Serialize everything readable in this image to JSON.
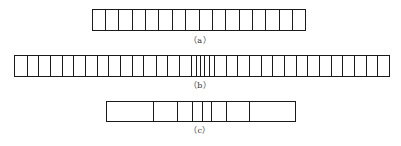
{
  "figure": {
    "colors": {
      "line": "#1a1a1a",
      "caption": "#333333",
      "background": "#ffffff"
    },
    "strips": [
      {
        "id": "a",
        "caption": "（a）",
        "description": "16 equal-width cells",
        "box": {
          "left": 92,
          "top": 9,
          "right": 306,
          "bottom": 31
        },
        "dividers": [
          105.4,
          118.8,
          132.1,
          145.5,
          158.9,
          172.3,
          185.6,
          199,
          212.4,
          225.8,
          239.1,
          252.5,
          265.9,
          279.3,
          292.6
        ],
        "caption_pos": {
          "x": 200,
          "y": 36
        }
      },
      {
        "id": "b",
        "caption": "（b）",
        "description": "uniform cells with a cluster of narrow cells near the center",
        "box": {
          "left": 14,
          "top": 55,
          "right": 390,
          "bottom": 77
        },
        "dividers": [
          27,
          38,
          50,
          62,
          73,
          85,
          97,
          108,
          120,
          132,
          143,
          156,
          167,
          179,
          191,
          196,
          200,
          204,
          209,
          214,
          226,
          237,
          249,
          261,
          272,
          284,
          296,
          307,
          319,
          331,
          342,
          354,
          366,
          377
        ],
        "caption_pos": {
          "x": 200,
          "y": 81
        }
      },
      {
        "id": "c",
        "caption": "（c）",
        "description": "cells narrowing toward the center, wide at both ends",
        "box": {
          "left": 106,
          "top": 101,
          "right": 296,
          "bottom": 122
        },
        "dividers": [
          153,
          177,
          192,
          202,
          211,
          226,
          249
        ],
        "caption_pos": {
          "x": 200,
          "y": 126
        }
      }
    ]
  }
}
